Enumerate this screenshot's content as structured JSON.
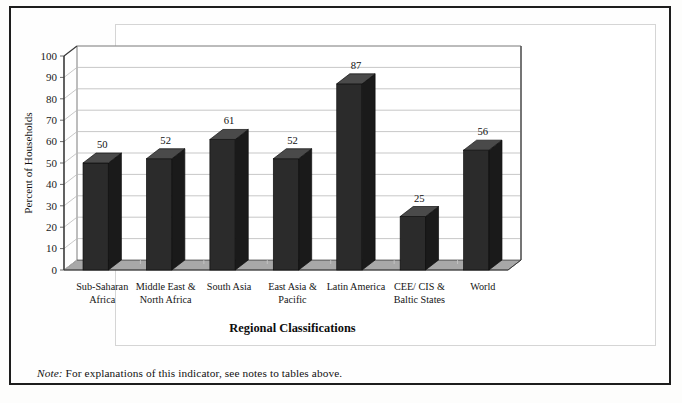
{
  "figure": {
    "note_label": "Note:",
    "note_text": " For explanations of this indicator, see notes to tables above."
  },
  "chart_data": {
    "type": "bar",
    "title": "",
    "xlabel": "Regional Classifications",
    "ylabel": "Percent of Households",
    "categories": [
      "Sub-Saharan Africa",
      "Middle East & North Africa",
      "South Asia",
      "East Asia & Pacific",
      "Latin America",
      "CEE/ CIS & Baltic States",
      "World"
    ],
    "category_lines": [
      [
        "Sub-Saharan",
        "Africa"
      ],
      [
        "Middle East &",
        "North Africa"
      ],
      [
        "South Asia"
      ],
      [
        "East Asia &",
        "Pacific"
      ],
      [
        "Latin America"
      ],
      [
        "CEE/ CIS &",
        "Baltic States"
      ],
      [
        "World"
      ]
    ],
    "values": [
      50,
      52,
      61,
      52,
      87,
      25,
      56
    ],
    "value_labels": [
      "50",
      "52",
      "61",
      "52",
      "87",
      "25",
      "56"
    ],
    "ylim": [
      0,
      100
    ],
    "yticks": [
      0,
      10,
      20,
      30,
      40,
      50,
      60,
      70,
      80,
      90,
      100
    ],
    "ytick_labels": [
      "0",
      "10",
      "20",
      "30",
      "40",
      "50",
      "60",
      "70",
      "80",
      "90",
      "100"
    ],
    "grid": true,
    "legend": false,
    "style": "3d-column",
    "colors": {
      "bar_front": "#2b2b2b",
      "bar_side": "#1a1a1a",
      "bar_top": "#4a4a4a",
      "floor": "#a8a8a8",
      "wall": "#ffffff",
      "gridline": "#b9b9b9",
      "axis": "#5a5a5a"
    }
  }
}
